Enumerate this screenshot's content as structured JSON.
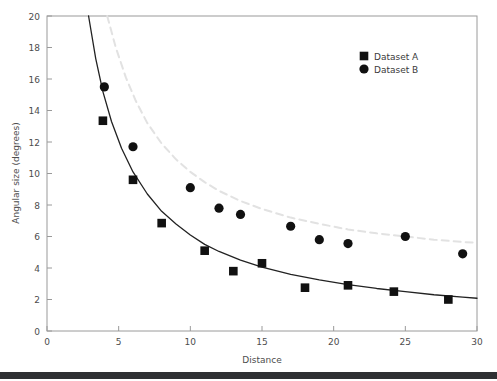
{
  "chart_data": {
    "type": "scatter",
    "title": "",
    "xlabel": "Distance",
    "ylabel": "Angular size (degrees)",
    "xlim": [
      0,
      30
    ],
    "ylim": [
      0,
      20
    ],
    "xticks": [
      0,
      5,
      10,
      15,
      20,
      25,
      30
    ],
    "yticks": [
      0,
      2,
      4,
      6,
      8,
      10,
      12,
      14,
      16,
      18,
      20
    ],
    "grid": false,
    "legend_position": "top-right",
    "series": [
      {
        "name": "Dataset A",
        "marker": "square",
        "color": "#111111",
        "x": [
          3.9,
          6.0,
          8.0,
          11.0,
          13.0,
          15.0,
          18.0,
          21.0,
          24.2,
          28.0
        ],
        "y": [
          13.35,
          9.6,
          6.85,
          5.1,
          3.8,
          4.3,
          2.75,
          2.9,
          2.5,
          2.0
        ],
        "fit": {
          "style": "solid",
          "color": "#222222",
          "x": [
            2.9,
            3.4,
            3.9,
            4.5,
            5.2,
            6.0,
            7.0,
            8.0,
            9.0,
            10.0,
            11.0,
            12.0,
            13.5,
            15.0,
            17.0,
            19.0,
            21.0,
            23.0,
            25.0,
            27.0,
            29.0,
            30.0
          ],
          "y": [
            20.0,
            17.3,
            15.2,
            13.3,
            11.6,
            10.1,
            8.7,
            7.6,
            6.8,
            6.1,
            5.5,
            5.05,
            4.5,
            4.05,
            3.6,
            3.25,
            2.95,
            2.7,
            2.5,
            2.3,
            2.15,
            2.08
          ]
        }
      },
      {
        "name": "Dataset B",
        "marker": "circle",
        "color": "#111111",
        "x": [
          4.0,
          6.0,
          10.0,
          12.0,
          13.5,
          17.0,
          19.0,
          21.0,
          25.0,
          29.0
        ],
        "y": [
          15.5,
          11.7,
          9.1,
          7.8,
          7.4,
          6.65,
          5.8,
          5.55,
          6.0,
          4.9
        ],
        "fit": {
          "style": "dashed",
          "color": "#e2e2e2",
          "x": [
            4.2,
            4.8,
            5.5,
            6.2,
            7.0,
            8.0,
            9.0,
            10.0,
            11.0,
            12.0,
            13.5,
            15.0,
            17.0,
            19.0,
            21.0,
            23.0,
            25.0,
            27.0,
            29.0,
            30.0
          ],
          "y": [
            20.0,
            18.0,
            16.1,
            14.6,
            13.2,
            11.9,
            10.9,
            10.1,
            9.45,
            8.9,
            8.25,
            7.75,
            7.2,
            6.8,
            6.45,
            6.2,
            6.0,
            5.8,
            5.65,
            5.6
          ]
        }
      }
    ]
  },
  "legend": {
    "items": [
      {
        "label": "Dataset A",
        "marker": "square"
      },
      {
        "label": "Dataset B",
        "marker": "circle"
      }
    ]
  }
}
